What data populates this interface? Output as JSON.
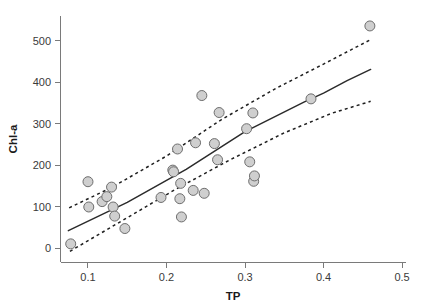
{
  "chart_data": {
    "type": "scatter",
    "title": "",
    "subtitle": "",
    "xlabel": "TP",
    "ylabel": "Chl-a",
    "xlim": [
      0.065,
      0.505
    ],
    "ylim": [
      -35,
      560
    ],
    "grid": false,
    "legend": null,
    "xticks": [
      0.1,
      0.2,
      0.3,
      0.4,
      0.5
    ],
    "xtick_labels": [
      "0.1",
      "0.2",
      "0.3",
      "0.4",
      "0.5"
    ],
    "yticks": [
      0,
      100,
      200,
      300,
      400,
      500
    ],
    "ytick_labels": [
      "0",
      "100",
      "200",
      "300",
      "400",
      "500"
    ],
    "marker_style": {
      "shape": "circle",
      "fill": "#cfcfcf",
      "edge": "#6e6e6e",
      "size_px": 5
    },
    "points": [
      {
        "x": 0.078,
        "y": 10
      },
      {
        "x": 0.1,
        "y": 160
      },
      {
        "x": 0.101,
        "y": 99
      },
      {
        "x": 0.118,
        "y": 112
      },
      {
        "x": 0.124,
        "y": 124
      },
      {
        "x": 0.13,
        "y": 147
      },
      {
        "x": 0.132,
        "y": 99
      },
      {
        "x": 0.134,
        "y": 77
      },
      {
        "x": 0.147,
        "y": 47
      },
      {
        "x": 0.193,
        "y": 122
      },
      {
        "x": 0.208,
        "y": 188
      },
      {
        "x": 0.209,
        "y": 184
      },
      {
        "x": 0.214,
        "y": 239
      },
      {
        "x": 0.217,
        "y": 119
      },
      {
        "x": 0.218,
        "y": 156
      },
      {
        "x": 0.219,
        "y": 75
      },
      {
        "x": 0.234,
        "y": 139
      },
      {
        "x": 0.237,
        "y": 254
      },
      {
        "x": 0.245,
        "y": 368
      },
      {
        "x": 0.248,
        "y": 132
      },
      {
        "x": 0.261,
        "y": 252
      },
      {
        "x": 0.265,
        "y": 213
      },
      {
        "x": 0.267,
        "y": 327
      },
      {
        "x": 0.302,
        "y": 288
      },
      {
        "x": 0.306,
        "y": 208
      },
      {
        "x": 0.31,
        "y": 326
      },
      {
        "x": 0.311,
        "y": 161
      },
      {
        "x": 0.312,
        "y": 174
      },
      {
        "x": 0.384,
        "y": 360
      },
      {
        "x": 0.459,
        "y": 536
      }
    ],
    "fit_line": {
      "style": "solid",
      "label": "regression fit",
      "points": [
        {
          "x": 0.075,
          "y": 42
        },
        {
          "x": 0.15,
          "y": 110
        },
        {
          "x": 0.225,
          "y": 190
        },
        {
          "x": 0.3,
          "y": 281
        },
        {
          "x": 0.375,
          "y": 352
        },
        {
          "x": 0.4,
          "y": 374
        },
        {
          "x": 0.43,
          "y": 404
        },
        {
          "x": 0.46,
          "y": 431
        }
      ]
    },
    "confidence_upper": {
      "style": "dotted",
      "label": "upper confidence band",
      "points": [
        {
          "x": 0.076,
          "y": 97
        },
        {
          "x": 0.13,
          "y": 146
        },
        {
          "x": 0.2,
          "y": 222
        },
        {
          "x": 0.27,
          "y": 310
        },
        {
          "x": 0.34,
          "y": 386
        },
        {
          "x": 0.4,
          "y": 444
        },
        {
          "x": 0.46,
          "y": 503
        }
      ]
    },
    "confidence_lower": {
      "style": "dotted",
      "label": "lower confidence band",
      "points": [
        {
          "x": 0.077,
          "y": -8
        },
        {
          "x": 0.14,
          "y": 62
        },
        {
          "x": 0.21,
          "y": 140
        },
        {
          "x": 0.28,
          "y": 212
        },
        {
          "x": 0.35,
          "y": 278
        },
        {
          "x": 0.41,
          "y": 325
        },
        {
          "x": 0.46,
          "y": 354
        }
      ]
    }
  }
}
